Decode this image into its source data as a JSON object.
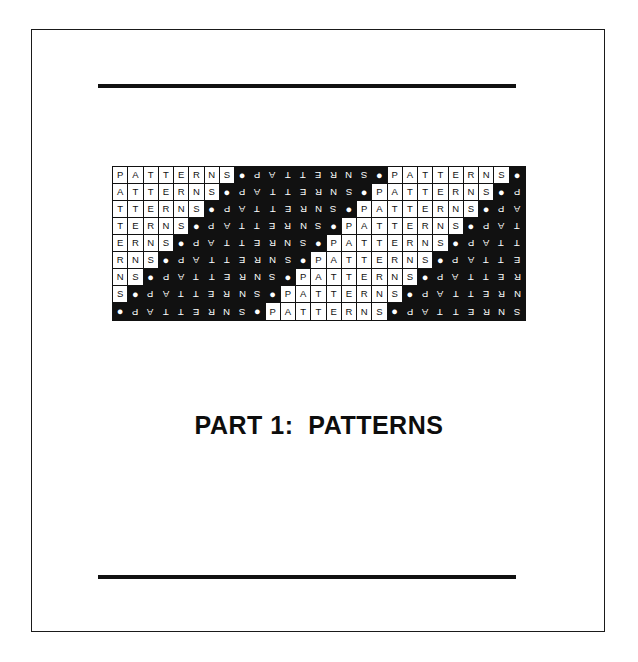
{
  "page": {
    "background_color": "#ffffff",
    "border_color": "#1a1a1a"
  },
  "rules": {
    "color": "#111111",
    "top_label": "top-horizontal-rule",
    "bottom_label": "bottom-horizontal-rule"
  },
  "title": {
    "text": "PART 1:  PATTERNS",
    "part_number": "1",
    "part_word": "PART",
    "subject": "PATTERNS",
    "color": "#0d0d0d"
  },
  "pattern_grid": {
    "word": "PATTERNS",
    "separator_glyph": "●",
    "separator_name": "filled-circle",
    "unit": [
      "P",
      "A",
      "T",
      "T",
      "E",
      "R",
      "N",
      "S",
      "●"
    ],
    "columns": 27,
    "rows": 9,
    "cell_width_px": 15.26,
    "cell_height_px": 17,
    "ink_color": "#111111",
    "paper_color": "#ffffff",
    "description": "Repeating PATTERNS word band; each row is shifted one cell left relative to the row above, and alternate nine-cell runs are printed as white-on-black rotated 180 degrees.",
    "row_shifts": [
      0,
      1,
      2,
      3,
      4,
      5,
      6,
      7,
      8
    ],
    "rows_text": [
      "P A T T E R N S ● S N R E T T A P ● P A T T E R N S ●",
      "A T T E R N S ● S N R E T T A P ● P A T T E R N S ● S",
      "T T E R N S ● S N R E T T A P ● P A T T E R N S ● S N",
      "T E R N S ● S N R E T T A P ● P A T T E R N S ● S N R",
      "E R N S ● S N R E T T A P ● P A T T E R N S ● S N R E",
      "R N S ● S N R E T T A P ● P A T T E R N S ● S N R E T",
      "N S ● S N R E T T A P ● P A T T E R N S ● S N R E T T",
      "S ● S N R E T T A P ● P A T T E R N S ● S N R E T T A",
      "● S N R E T T A P ● P A T T E R N S ● S N R E T T A P"
    ]
  }
}
